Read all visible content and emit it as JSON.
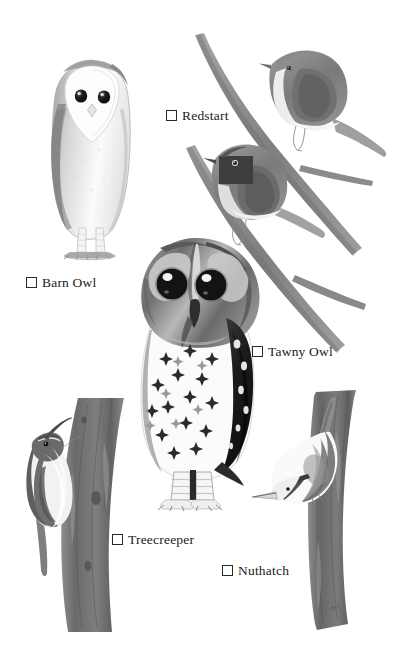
{
  "page": {
    "kind": "illustrated-bird-checklist",
    "background_color": "#ffffff",
    "width": 412,
    "height": 668,
    "palette": {
      "ink": "#1a1a1a",
      "wash_light": "#d8d8d8",
      "wash_mid": "#9a9a9a",
      "wash_dark": "#6d6d6d",
      "wash_darkest": "#3a3a3a"
    }
  },
  "checklist": {
    "items": [
      {
        "id": "barn-owl",
        "label": "Barn Owl",
        "checked": false,
        "checkbox_glyph": "empty-square",
        "illustration": "barn-owl-standing",
        "pose": "front-facing perched owl, pale heart-shaped face, dark eyes, mottled grey wings, barred legs"
      },
      {
        "id": "redstart",
        "label": "Redstart",
        "checked": false,
        "checkbox_glyph": "empty-square",
        "illustration": "two-redstarts-on-branches",
        "pose": "two small perched songbirds on crossing bare branches, upper bird plain faced, lower bird with dark face mask"
      },
      {
        "id": "tawny-owl",
        "label": "Tawny Owl",
        "checked": false,
        "checkbox_glyph": "empty-square",
        "illustration": "tawny-owl-standing",
        "pose": "large round-headed owl facing forward, big black eyes, white breast with dark star-shaped speckles, dark folded wing"
      },
      {
        "id": "treecreeper",
        "label": "Treecreeper",
        "checked": false,
        "checkbox_glyph": "empty-square",
        "illustration": "treecreeper-on-trunk",
        "pose": "small bird climbing head-up on a vertical tree trunk, curved decurved bill, white underside, stiff tail"
      },
      {
        "id": "nuthatch",
        "label": "Nuthatch",
        "checked": false,
        "checkbox_glyph": "empty-square",
        "illustration": "nuthatch-on-trunk",
        "pose": "stocky bird descending head-down on a vertical tree trunk, straight dagger bill, pale underside"
      }
    ]
  },
  "artwork": {
    "medium": "grayscale watercolour",
    "elements": [
      {
        "name": "barn-owl-figure",
        "region": "upper-left"
      },
      {
        "name": "redstart-upper-figure",
        "region": "upper-right"
      },
      {
        "name": "redstart-lower-figure",
        "region": "mid-right"
      },
      {
        "name": "bare-branch-long",
        "region": "right"
      },
      {
        "name": "bare-branch-lower",
        "region": "right"
      },
      {
        "name": "tawny-owl-figure",
        "region": "center"
      },
      {
        "name": "tree-trunk-left",
        "region": "lower-left"
      },
      {
        "name": "treecreeper-figure",
        "region": "lower-left"
      },
      {
        "name": "tree-trunk-right",
        "region": "lower-right"
      },
      {
        "name": "nuthatch-figure",
        "region": "lower-right"
      },
      {
        "name": "artist-signature",
        "region": "lower-right-trunk"
      }
    ]
  }
}
